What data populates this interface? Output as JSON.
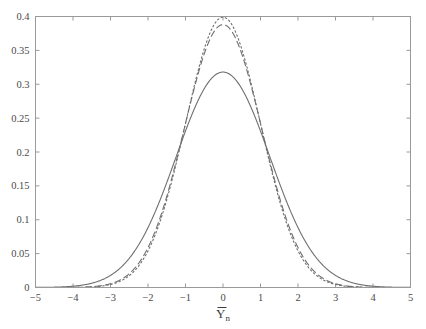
{
  "figure": {
    "background_color": "#ffffff",
    "frame_color": "#9a9a9a",
    "curve_color": "#6f6f6f",
    "tick_label_color": "#4a4a4a",
    "axis_title_main": "Y",
    "axis_title_sub": "n",
    "axis_title_full": "Ȳn"
  },
  "chart_data": {
    "type": "line",
    "title": "",
    "xlabel": "Ȳn",
    "ylabel": "",
    "xlim": [
      -5,
      5
    ],
    "ylim": [
      0,
      0.4
    ],
    "grid": false,
    "legend_position": "none",
    "xticks": [
      -5,
      -4,
      -3,
      -2,
      -1,
      0,
      1,
      2,
      3,
      4,
      5
    ],
    "xtick_labels": [
      "-5",
      "-4",
      "-3",
      "-2",
      "-1",
      "0",
      "1",
      "2",
      "3",
      "4",
      "5"
    ],
    "yticks": [
      0,
      0.05,
      0.1,
      0.15,
      0.2,
      0.25,
      0.3,
      0.35,
      0.4
    ],
    "ytick_labels": [
      "0",
      "0.05",
      "0.1",
      "0.15",
      "0.2",
      "0.25",
      "0.3",
      "0.35",
      "0.4"
    ],
    "series": [
      {
        "name": "dotted",
        "linestyle": "dotted",
        "peak_x": 0,
        "peak_y": 0.399,
        "sigma": 1.0,
        "x": [
          -5,
          -4.75,
          -4.5,
          -4.25,
          -4,
          -3.75,
          -3.5,
          -3.25,
          -3,
          -2.75,
          -2.5,
          -2.25,
          -2,
          -1.75,
          -1.5,
          -1.25,
          -1,
          -0.75,
          -0.5,
          -0.25,
          0,
          0.25,
          0.5,
          0.75,
          1,
          1.25,
          1.5,
          1.75,
          2,
          2.25,
          2.5,
          2.75,
          3,
          3.25,
          3.5,
          3.75,
          4,
          4.25,
          4.5,
          4.75,
          5
        ],
        "values": [
          0.0,
          0.0,
          0.0,
          0.0001,
          0.0001,
          0.0004,
          0.0009,
          0.002,
          0.0044,
          0.0091,
          0.0175,
          0.0317,
          0.054,
          0.0863,
          0.1295,
          0.1826,
          0.242,
          0.3011,
          0.3521,
          0.3867,
          0.3989,
          0.3867,
          0.3521,
          0.3011,
          0.242,
          0.1826,
          0.1295,
          0.0863,
          0.054,
          0.0317,
          0.0175,
          0.0091,
          0.0044,
          0.002,
          0.0009,
          0.0004,
          0.0001,
          0.0001,
          0.0,
          0.0,
          0.0
        ]
      },
      {
        "name": "dashed",
        "linestyle": "dashed",
        "peak_x": 0,
        "peak_y": 0.388,
        "sigma": 1.03,
        "x": [
          -5,
          -4.75,
          -4.5,
          -4.25,
          -4,
          -3.75,
          -3.5,
          -3.25,
          -3,
          -2.75,
          -2.5,
          -2.25,
          -2,
          -1.75,
          -1.5,
          -1.25,
          -1,
          -0.75,
          -0.5,
          -0.25,
          0,
          0.25,
          0.5,
          0.75,
          1,
          1.25,
          1.5,
          1.75,
          2,
          2.25,
          2.5,
          2.75,
          3,
          3.25,
          3.5,
          3.75,
          4,
          4.25,
          4.5,
          4.75,
          5
        ],
        "values": [
          0.0,
          0.0,
          0.0001,
          0.0002,
          0.0004,
          0.0008,
          0.0017,
          0.0034,
          0.0066,
          0.0123,
          0.0218,
          0.037,
          0.0601,
          0.093,
          0.1373,
          0.1912,
          0.2504,
          0.3073,
          0.3531,
          0.3821,
          0.388,
          0.3821,
          0.3531,
          0.3073,
          0.2504,
          0.1912,
          0.1373,
          0.093,
          0.0601,
          0.037,
          0.0218,
          0.0123,
          0.0066,
          0.0034,
          0.0017,
          0.0008,
          0.0004,
          0.0002,
          0.0001,
          0.0,
          0.0
        ]
      },
      {
        "name": "solid",
        "linestyle": "solid",
        "peak_x": 0,
        "peak_y": 0.318,
        "sigma": 1.25,
        "x": [
          -5,
          -4.75,
          -4.5,
          -4.25,
          -4,
          -3.75,
          -3.5,
          -3.25,
          -3,
          -2.75,
          -2.5,
          -2.25,
          -2,
          -1.75,
          -1.5,
          -1.25,
          -1,
          -0.75,
          -0.5,
          -0.25,
          0,
          0.25,
          0.5,
          0.75,
          1,
          1.25,
          1.5,
          1.75,
          2,
          2.25,
          2.5,
          2.75,
          3,
          3.25,
          3.5,
          3.75,
          4,
          4.25,
          4.5,
          4.75,
          5
        ],
        "values": [
          0.0013,
          0.0021,
          0.0032,
          0.0048,
          0.0071,
          0.0102,
          0.0144,
          0.0199,
          0.027,
          0.0359,
          0.0467,
          0.0595,
          0.0742,
          0.0904,
          0.1076,
          0.1252,
          0.1423,
          0.1581,
          0.1716,
          0.182,
          0.1885,
          0.182,
          0.1716,
          0.1581,
          0.1423,
          0.1252,
          0.1076,
          0.0904,
          0.0742,
          0.0595,
          0.0467,
          0.0359,
          0.027,
          0.0199,
          0.0144,
          0.0102,
          0.0071,
          0.0048,
          0.0032,
          0.0021,
          0.0013
        ]
      }
    ]
  }
}
